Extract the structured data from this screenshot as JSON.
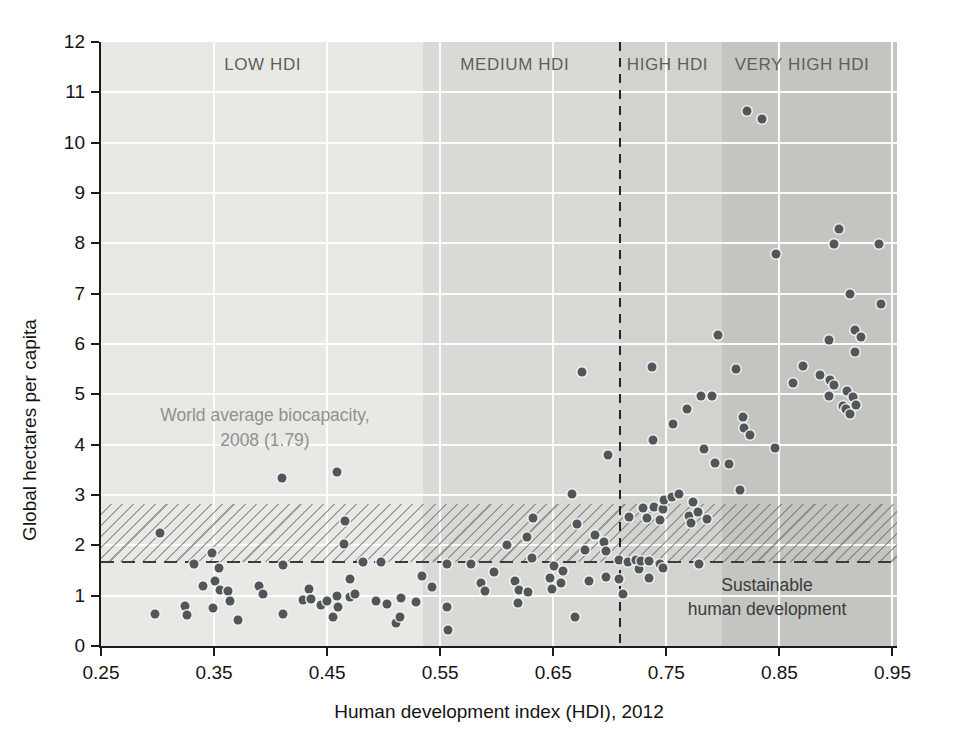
{
  "figure": {
    "width_px": 957,
    "height_px": 753,
    "background": "#ffffff"
  },
  "chart_data": {
    "type": "scatter",
    "title": "",
    "xlabel": "Human development index (HDI), 2012",
    "ylabel": "Global hectares per capita",
    "xlim": [
      0.25,
      0.954
    ],
    "ylim": [
      0,
      12
    ],
    "xticks": [
      0.25,
      0.35,
      0.45,
      0.55,
      0.65,
      0.75,
      0.85,
      0.95
    ],
    "yticks": [
      0,
      1,
      2,
      3,
      4,
      5,
      6,
      7,
      8,
      9,
      10,
      11,
      12
    ],
    "gridline_color": "#ffffff",
    "point_color": "#51565a",
    "regions": [
      {
        "label": "LOW HDI",
        "from": 0.25,
        "to": 0.535,
        "color": "#e8e9e5",
        "label_x": 0.393
      },
      {
        "label": "MEDIUM HDI",
        "from": 0.535,
        "to": 0.709,
        "color": "#d9dad6",
        "label_x": 0.616
      },
      {
        "label": "HIGH HDI",
        "from": 0.709,
        "to": 0.799,
        "color": "#d2d3cf",
        "label_x": 0.751
      },
      {
        "label": "VERY HIGH HDI",
        "from": 0.799,
        "to": 0.954,
        "color": "#c4c5c1",
        "label_x": 0.87
      }
    ],
    "hatch_band": {
      "y_from": 1.66,
      "y_to": 2.82
    },
    "lines": {
      "world_biocapacity": {
        "orientation": "horizontal",
        "style": "dashed",
        "y": 1.66,
        "value_label": "1.79"
      },
      "hdi_threshold": {
        "orientation": "vertical",
        "style": "dashed",
        "x": 0.709
      }
    },
    "annotations": {
      "biocapacity": {
        "line1": "World average biocapacity,",
        "line2": "2008 (1.79)",
        "x": 0.395,
        "y": 4.33
      },
      "sustainable": {
        "line1": "Sustainable",
        "line2": "human development",
        "x": 0.839,
        "y": 0.97
      }
    },
    "points": [
      [
        0.302,
        2.25
      ],
      [
        0.298,
        0.63
      ],
      [
        0.324,
        0.8
      ],
      [
        0.326,
        0.62
      ],
      [
        0.332,
        1.62
      ],
      [
        0.34,
        1.2
      ],
      [
        0.348,
        1.84
      ],
      [
        0.351,
        1.29
      ],
      [
        0.349,
        0.75
      ],
      [
        0.354,
        1.54
      ],
      [
        0.355,
        1.12
      ],
      [
        0.362,
        1.1
      ],
      [
        0.364,
        0.9
      ],
      [
        0.371,
        0.51
      ],
      [
        0.39,
        1.2
      ],
      [
        0.393,
        1.03
      ],
      [
        0.41,
        3.34
      ],
      [
        0.411,
        1.61
      ],
      [
        0.411,
        0.63
      ],
      [
        0.429,
        0.92
      ],
      [
        0.434,
        1.13
      ],
      [
        0.436,
        0.93
      ],
      [
        0.445,
        0.81
      ],
      [
        0.45,
        0.9
      ],
      [
        0.455,
        0.57
      ],
      [
        0.459,
        3.46
      ],
      [
        0.459,
        0.99
      ],
      [
        0.46,
        0.78
      ],
      [
        0.466,
        2.49
      ],
      [
        0.465,
        2.02
      ],
      [
        0.47,
        1.33
      ],
      [
        0.47,
        0.98
      ],
      [
        0.475,
        1.04
      ],
      [
        0.482,
        1.66
      ],
      [
        0.493,
        0.9
      ],
      [
        0.498,
        1.66
      ],
      [
        0.503,
        0.83
      ],
      [
        0.511,
        0.45
      ],
      [
        0.515,
        0.96
      ],
      [
        0.514,
        0.58
      ],
      [
        0.529,
        0.88
      ],
      [
        0.534,
        1.39
      ],
      [
        0.543,
        1.18
      ],
      [
        0.556,
        1.62
      ],
      [
        0.556,
        0.78
      ],
      [
        0.557,
        0.31
      ],
      [
        0.577,
        1.62
      ],
      [
        0.586,
        1.26
      ],
      [
        0.59,
        1.09
      ],
      [
        0.598,
        1.47
      ],
      [
        0.609,
        2.0
      ],
      [
        0.616,
        1.29
      ],
      [
        0.62,
        1.12
      ],
      [
        0.619,
        0.86
      ],
      [
        0.627,
        2.16
      ],
      [
        0.628,
        1.08
      ],
      [
        0.632,
        2.54
      ],
      [
        0.631,
        1.75
      ],
      [
        0.647,
        1.36
      ],
      [
        0.649,
        1.14
      ],
      [
        0.651,
        1.59
      ],
      [
        0.657,
        1.26
      ],
      [
        0.659,
        1.5
      ],
      [
        0.667,
        3.02
      ],
      [
        0.669,
        0.58
      ],
      [
        0.671,
        2.43
      ],
      [
        0.675,
        5.45
      ],
      [
        0.678,
        1.9
      ],
      [
        0.682,
        1.29
      ],
      [
        0.687,
        2.21
      ],
      [
        0.695,
        2.07
      ],
      [
        0.697,
        1.88
      ],
      [
        0.697,
        1.37
      ],
      [
        0.698,
        3.8
      ],
      [
        0.708,
        1.7
      ],
      [
        0.708,
        1.33
      ],
      [
        0.712,
        1.03
      ],
      [
        0.716,
        1.66
      ],
      [
        0.717,
        2.57
      ],
      [
        0.723,
        1.7
      ],
      [
        0.726,
        1.52
      ],
      [
        0.728,
        1.68
      ],
      [
        0.729,
        2.74
      ],
      [
        0.733,
        2.55
      ],
      [
        0.735,
        1.68
      ],
      [
        0.735,
        1.36
      ],
      [
        0.737,
        5.55
      ],
      [
        0.738,
        4.1
      ],
      [
        0.739,
        2.77
      ],
      [
        0.744,
        2.51
      ],
      [
        0.744,
        1.62
      ],
      [
        0.747,
        2.72
      ],
      [
        0.747,
        1.54
      ],
      [
        0.748,
        2.91
      ],
      [
        0.755,
        2.96
      ],
      [
        0.756,
        4.42
      ],
      [
        0.761,
        3.02
      ],
      [
        0.768,
        4.71
      ],
      [
        0.77,
        2.59
      ],
      [
        0.772,
        2.45
      ],
      [
        0.774,
        2.86
      ],
      [
        0.778,
        2.67
      ],
      [
        0.779,
        1.62
      ],
      [
        0.781,
        4.97
      ],
      [
        0.783,
        3.91
      ],
      [
        0.786,
        2.53
      ],
      [
        0.79,
        4.97
      ],
      [
        0.793,
        3.64
      ],
      [
        0.796,
        6.18
      ],
      [
        0.805,
        3.61
      ],
      [
        0.812,
        5.51
      ],
      [
        0.815,
        3.1
      ],
      [
        0.818,
        4.55
      ],
      [
        0.819,
        4.33
      ],
      [
        0.824,
        4.19
      ],
      [
        0.821,
        10.62
      ],
      [
        0.835,
        10.48
      ],
      [
        0.846,
        3.94
      ],
      [
        0.847,
        7.78
      ],
      [
        0.862,
        5.23
      ],
      [
        0.871,
        5.56
      ],
      [
        0.886,
        5.38
      ],
      [
        0.894,
        6.08
      ],
      [
        0.895,
        5.28
      ],
      [
        0.898,
        5.19
      ],
      [
        0.898,
        7.99
      ],
      [
        0.894,
        4.97
      ],
      [
        0.903,
        8.28
      ],
      [
        0.906,
        4.76
      ],
      [
        0.909,
        4.71
      ],
      [
        0.91,
        5.07
      ],
      [
        0.912,
        6.99
      ],
      [
        0.912,
        4.61
      ],
      [
        0.915,
        4.95
      ],
      [
        0.917,
        5.84
      ],
      [
        0.917,
        6.27
      ],
      [
        0.918,
        4.79
      ],
      [
        0.922,
        6.14
      ],
      [
        0.94,
        6.8
      ],
      [
        0.938,
        7.99
      ]
    ]
  }
}
